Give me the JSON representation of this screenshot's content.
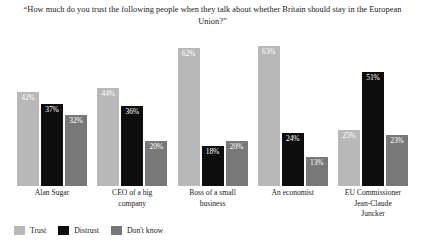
{
  "chart_data": {
    "type": "bar",
    "title": "“How much do you trust the following people when they talk about whether Britain should stay in the European Union?”",
    "title_line1": "“How much do you trust the following people when they talk about whether Britain should stay in",
    "title_line2": "the European Union?”",
    "xlabel": "",
    "ylabel": "",
    "ylim": [
      0,
      70
    ],
    "grid": false,
    "legend_position": "bottom-left",
    "value_suffix": "%",
    "categories": [
      "Alan Sugar",
      "CEO of a big company",
      "Boss of a small business",
      "An economist",
      "EU Commissioner Jean-Claude Juncker"
    ],
    "category_lines": [
      [
        "Alan Sugar"
      ],
      [
        "CEO of a big",
        "company"
      ],
      [
        "Boss of a small",
        "business"
      ],
      [
        "An economist"
      ],
      [
        "EU Commissioner",
        "Jean-Claude",
        "Juncker"
      ]
    ],
    "series": [
      {
        "name": "Trust",
        "color": "#b8b8b8",
        "values": [
          42,
          44,
          62,
          63,
          25
        ],
        "labels": [
          "42%",
          "44%",
          "62%",
          "63%",
          "25%"
        ]
      },
      {
        "name": "Distrust",
        "color": "#0d0d0d",
        "values": [
          37,
          36,
          18,
          24,
          51
        ],
        "labels": [
          "37%",
          "36%",
          "18%",
          "24%",
          "51%"
        ]
      },
      {
        "name": "Don't know",
        "color": "#787878",
        "values": [
          32,
          20,
          20,
          13,
          23
        ],
        "labels": [
          "32%",
          "20%",
          "20%",
          "13%",
          "23%"
        ]
      }
    ]
  },
  "legend": {
    "items": [
      {
        "label": "Trust",
        "color": "#b8b8b8"
      },
      {
        "label": "Distrust",
        "color": "#0d0d0d"
      },
      {
        "label": "Don't know",
        "color": "#787878"
      }
    ]
  }
}
